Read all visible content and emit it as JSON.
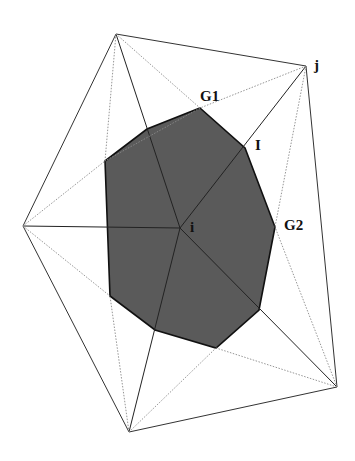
{
  "diagram": {
    "type": "triangulation-dual-cell",
    "colors": {
      "background": "#ffffff",
      "solid_edge": "#333333",
      "dotted_edge": "#8a8a8a",
      "cell_fill": "#5a5a5a",
      "cell_edge": "#111111"
    },
    "labels": {
      "j": "j",
      "G1": "G1",
      "I": "I",
      "G2": "G2",
      "i": "i"
    },
    "nodes": {
      "i": [
        180,
        228
      ],
      "j": [
        306,
        66
      ],
      "top": [
        116,
        34
      ],
      "left": [
        23,
        226
      ],
      "bottom": [
        129,
        432
      ],
      "bottom_right": [
        337,
        387
      ]
    },
    "shaded_cell_vertices": [
      [
        200,
        108
      ],
      [
        245,
        148
      ],
      [
        275,
        227
      ],
      [
        259,
        310
      ],
      [
        216,
        348
      ],
      [
        155,
        330
      ],
      [
        110,
        296
      ],
      [
        105,
        161
      ],
      [
        147,
        129
      ]
    ]
  }
}
